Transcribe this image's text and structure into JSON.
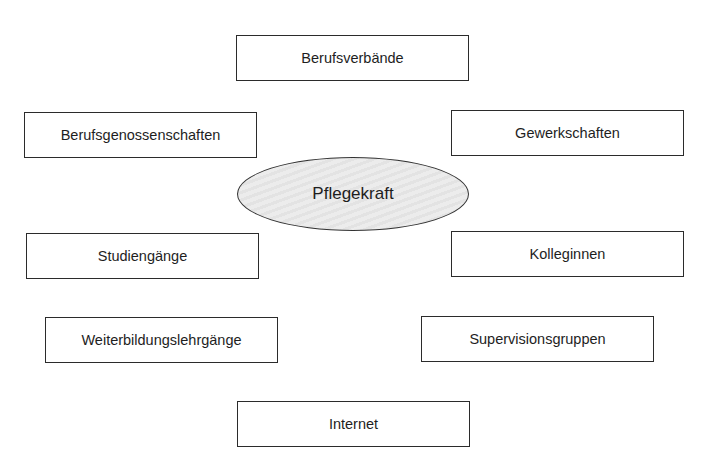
{
  "diagram": {
    "type": "mind-map",
    "center": {
      "label": "Pflegekraft",
      "shape": "ellipse",
      "fill": "#e8e8e8"
    },
    "nodes": [
      {
        "id": "berufsverbaende",
        "label": "Berufsverbände"
      },
      {
        "id": "berufsgenossenschaften",
        "label": "Berufsgenossenschaften"
      },
      {
        "id": "gewerkschaften",
        "label": "Gewerkschaften"
      },
      {
        "id": "studiengaenge",
        "label": "Studiengänge"
      },
      {
        "id": "kolleginnen",
        "label": "Kolleginnen"
      },
      {
        "id": "weiterbildungslehrgaenge",
        "label": "Weiterbildungslehrgänge"
      },
      {
        "id": "supervisionsgruppen",
        "label": "Supervisionsgruppen"
      },
      {
        "id": "internet",
        "label": "Internet"
      }
    ],
    "colors": {
      "border": "#2b2b2b",
      "text": "#1e1e1e",
      "background": "#ffffff"
    }
  }
}
